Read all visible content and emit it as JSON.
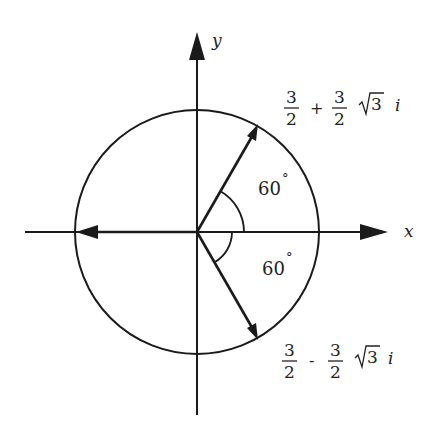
{
  "diagram": {
    "axes": {
      "x_label": "x",
      "y_label": "y"
    },
    "circle": {
      "center": [
        197,
        232
      ],
      "radius": 122
    },
    "vectors": [
      {
        "name": "upper",
        "angle_deg": 60,
        "label": {
          "num1": "3",
          "den1": "2",
          "op": "+",
          "num2": "3",
          "den2": "2",
          "root": "3",
          "imag": "i"
        }
      },
      {
        "name": "lower",
        "angle_deg": -60,
        "label": {
          "num1": "3",
          "den1": "2",
          "op": "-",
          "num2": "3",
          "den2": "2",
          "root": "3",
          "imag": "i"
        }
      },
      {
        "name": "left",
        "angle_deg": 180
      }
    ],
    "angles": [
      {
        "label": "60",
        "degree": "°"
      },
      {
        "label": "60",
        "degree": "°"
      }
    ],
    "colors": {
      "ink": "#1a1a1a",
      "background": "#ffffff"
    }
  }
}
